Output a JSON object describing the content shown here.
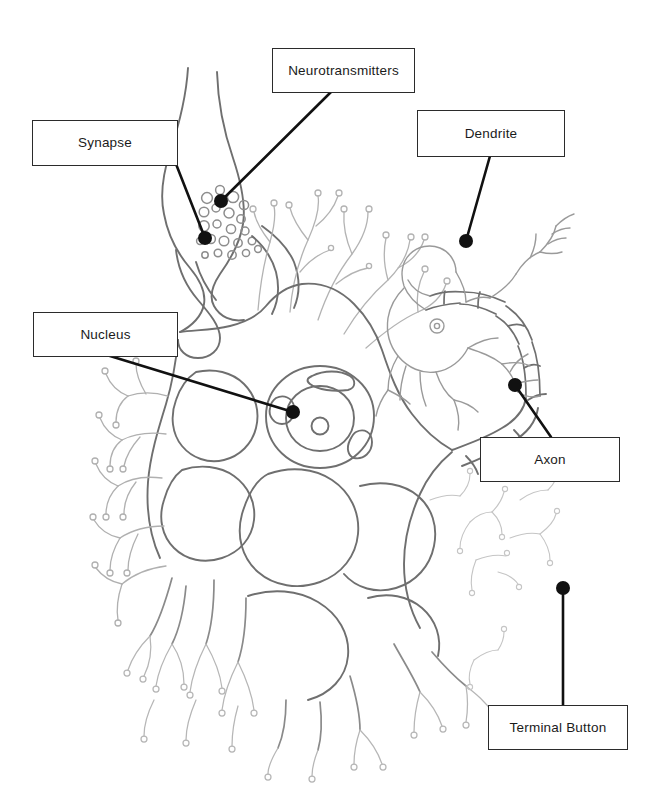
{
  "diagram": {
    "canvas": {
      "width": 661,
      "height": 792,
      "background": "#ffffff"
    },
    "style": {
      "leader_color": "#111111",
      "leader_width": 2.6,
      "dot_radius": 7,
      "box_border_color": "#2b2b2b",
      "box_fill": "#ffffff",
      "artwork_stroke_dark": "#6f6f6f",
      "artwork_stroke_light": "#a9a9a9",
      "artwork_stroke_faint": "#c2c2c2"
    },
    "labels": [
      {
        "id": "synapse",
        "text": "Synapse",
        "box": {
          "x": 32,
          "y": 120,
          "w": 146,
          "h": 46
        },
        "anchor": {
          "x": 205,
          "y": 238
        },
        "leader_from": {
          "x": 176,
          "y": 164
        }
      },
      {
        "id": "neurotransmitters",
        "text": "Neurotransmitters",
        "box": {
          "x": 272,
          "y": 48,
          "w": 143,
          "h": 45
        },
        "anchor": {
          "x": 221,
          "y": 201
        },
        "leader_from": {
          "x": 331,
          "y": 92
        }
      },
      {
        "id": "dendrite",
        "text": "Dendrite",
        "box": {
          "x": 417,
          "y": 110,
          "w": 148,
          "h": 47
        },
        "anchor": {
          "x": 466,
          "y": 241
        },
        "leader_from": {
          "x": 490,
          "y": 156
        }
      },
      {
        "id": "nucleus",
        "text": "Nucleus",
        "box": {
          "x": 33,
          "y": 312,
          "w": 145,
          "h": 45
        },
        "anchor": {
          "x": 293,
          "y": 412
        },
        "leader_from": {
          "x": 110,
          "y": 356
        }
      },
      {
        "id": "axon",
        "text": "Axon",
        "box": {
          "x": 480,
          "y": 437,
          "w": 140,
          "h": 45
        },
        "anchor": {
          "x": 515,
          "y": 385
        },
        "leader_from": {
          "x": 551,
          "y": 437
        }
      },
      {
        "id": "terminal-button",
        "text": "Terminal Button",
        "box": {
          "x": 488,
          "y": 705,
          "w": 140,
          "h": 45
        },
        "anchor": {
          "x": 563,
          "y": 588
        },
        "leader_from": {
          "x": 563,
          "y": 705
        }
      }
    ]
  }
}
